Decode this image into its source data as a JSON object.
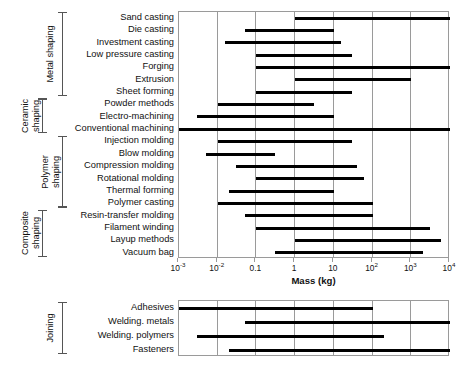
{
  "figure": {
    "axis_title": "Mass (kg)",
    "x_tick_labels": [
      "10⁻³",
      "10⁻²",
      "0.1",
      "1",
      "10",
      "10²",
      "10³",
      "10⁴"
    ],
    "x_tick_values": [
      -3,
      -2,
      -1,
      0,
      1,
      2,
      3,
      4
    ],
    "footnote": ""
  },
  "groups": [
    {
      "name": "Metal shaping",
      "label": "Metal shaping",
      "first_row": 0,
      "last_row": 6
    },
    {
      "name": "Ceramic shaping",
      "label": "Ceramic shaping",
      "first_row": 7,
      "last_row": 9
    },
    {
      "name": "Polymer shaping",
      "label": "Polymer shaping",
      "first_row": 10,
      "last_row": 15
    },
    {
      "name": "Composite shaping",
      "label": "Composite shaping",
      "first_row": 16,
      "last_row": 18
    },
    {
      "name": "Joining",
      "label": "Joining",
      "first_row": 0,
      "last_row": 3
    }
  ],
  "chart_data": {
    "type": "bar",
    "title": "",
    "subtitle": "",
    "xlabel": "Mass (kg)",
    "ylabel": "",
    "orientation": "horizontal",
    "xscale": "log",
    "xlim": [
      0.001,
      10000
    ],
    "xticks": [
      0.001,
      0.01,
      0.1,
      1,
      10,
      100,
      1000,
      10000
    ],
    "xticklabels": [
      "10⁻³",
      "10⁻²",
      "0.1",
      "1",
      "10",
      "10²",
      "10³",
      "10⁴"
    ],
    "grid": "vertical",
    "legend": "none",
    "note": "Each bar is a min-max mass range (kg) for a manufacturing process",
    "panels": [
      {
        "name": "shaping",
        "categories": [
          "Sand casting",
          "Die casting",
          "Investment casting",
          "Low pressure casting",
          "Forging",
          "Extrusion",
          "Sheet forming",
          "Powder methods",
          "Electro-machining",
          "Conventional machining",
          "Injection molding",
          "Blow molding",
          "Compression molding",
          "Rotational molding",
          "Thermal forming",
          "Polymer casting",
          "Resin-transfer molding",
          "Filament winding",
          "Layup methods",
          "Vacuum bag"
        ],
        "ranges": [
          [
            1,
            10000
          ],
          [
            0.05,
            10
          ],
          [
            0.015,
            15
          ],
          [
            0.1,
            30
          ],
          [
            0.1,
            10000
          ],
          [
            1,
            1000
          ],
          [
            0.1,
            30
          ],
          [
            0.01,
            3
          ],
          [
            0.003,
            10
          ],
          [
            0.0008,
            10000
          ],
          [
            0.01,
            30
          ],
          [
            0.005,
            0.3
          ],
          [
            0.03,
            40
          ],
          [
            0.1,
            60
          ],
          [
            0.02,
            10
          ],
          [
            0.01,
            100
          ],
          [
            0.05,
            100
          ],
          [
            0.1,
            3000
          ],
          [
            1,
            6000
          ],
          [
            0.3,
            2000
          ]
        ],
        "groups": [
          {
            "label": "Metal shaping",
            "start": "Sand casting",
            "end": "Sheet forming"
          },
          {
            "label": "Ceramic shaping",
            "start": "Powder methods",
            "end": "Conventional machining"
          },
          {
            "label": "Polymer shaping",
            "start": "Injection molding",
            "end": "Polymer casting"
          },
          {
            "label": "Composite shaping",
            "start": "Resin-transfer molding",
            "end": "Vacuum bag"
          }
        ]
      },
      {
        "name": "joining",
        "categories": [
          "Adhesives",
          "Welding. metals",
          "Welding. polymers",
          "Fasteners"
        ],
        "ranges": [
          [
            0.001,
            100
          ],
          [
            0.05,
            10000
          ],
          [
            0.003,
            200
          ],
          [
            0.02,
            10000
          ]
        ],
        "groups": [
          {
            "label": "Joining",
            "start": "Adhesives",
            "end": "Fasteners"
          }
        ]
      }
    ]
  },
  "colors": {
    "bar": "#000000",
    "grid": "#9a9a9a",
    "frame": "#9a9a9a",
    "text": "#111111",
    "background": "#ffffff"
  }
}
